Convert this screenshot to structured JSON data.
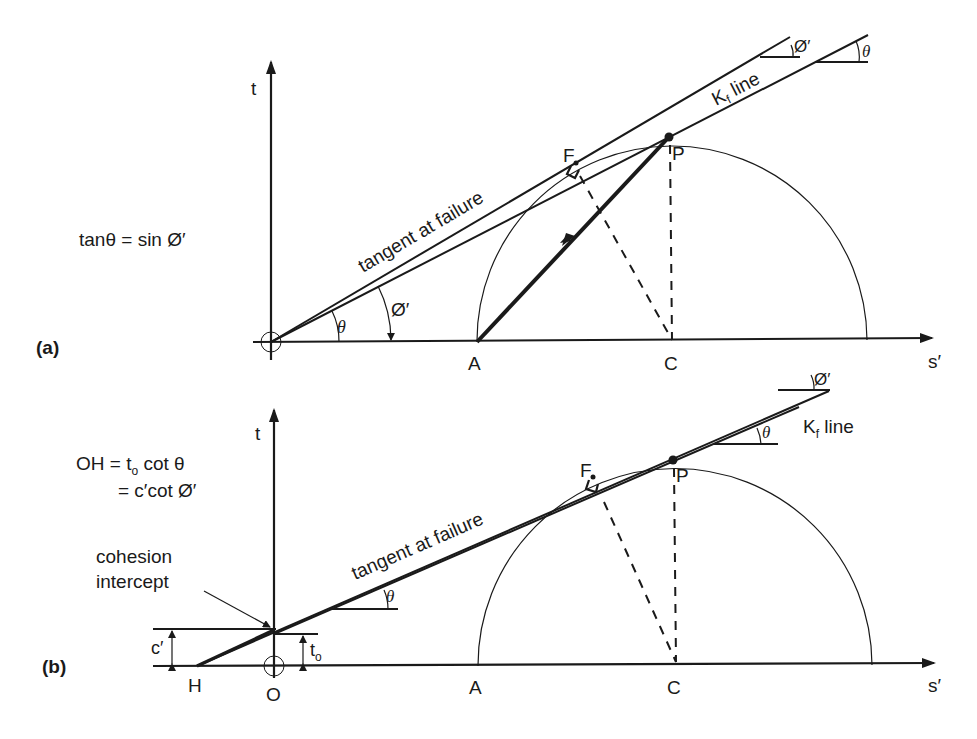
{
  "panel_a": {
    "tag": "(a)",
    "equation": "tanθ  = sin Ø′",
    "axis_t": "t",
    "axis_s": "s′",
    "points": {
      "A": "A",
      "C": "C",
      "P": "P",
      "F": "F"
    },
    "tangent_label": "tangent at failure",
    "kf_label_main": "K",
    "kf_label_sub": "f",
    "kf_label_rest": " line",
    "theta": "θ",
    "phi": "Ø′"
  },
  "panel_b": {
    "tag": "(b)",
    "equation_line1": "OH = t",
    "equation_line1_sub": "o",
    "equation_line1_rest": " cot θ",
    "equation_line2": "= c′cot Ø′",
    "axis_t": "t",
    "axis_s": "s′",
    "points": {
      "A": "A",
      "C": "C",
      "P": "P",
      "F": "F",
      "H": "H",
      "O": "O"
    },
    "tangent_label": "tangent at failure",
    "kf_label_main": "K",
    "kf_label_sub": "f",
    "kf_label_rest": " line",
    "cohesion_line1": "cohesion",
    "cohesion_line2": "intercept",
    "c_prime": "c′",
    "t_o_main": "t",
    "t_o_sub": "o",
    "theta": "θ",
    "phi": "Ø′"
  }
}
